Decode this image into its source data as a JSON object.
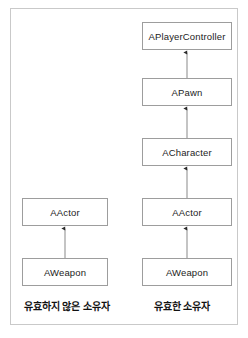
{
  "diagram": {
    "type": "class-inheritance-diagram",
    "frame": {
      "border_color": "#c9c9c9"
    },
    "box_style": {
      "border_color": "#9d9d9d",
      "fill": "#ffffff",
      "text_color": "#1c1c1c"
    },
    "arrow_style": {
      "line_color": "#9d9d9d",
      "head_color": "#2b2b2b",
      "direction": "points-up-to-parent"
    },
    "columns": [
      {
        "id": "invalid-owner",
        "caption": "유효하지 않은 소유자",
        "nodes": [
          {
            "id": "aactor-left",
            "label": "AActor"
          },
          {
            "id": "aweapon-left",
            "label": "AWeapon"
          }
        ],
        "edges": [
          {
            "from": "aweapon-left",
            "to": "aactor-left"
          }
        ]
      },
      {
        "id": "valid-owner",
        "caption": "유효한 소유자",
        "nodes": [
          {
            "id": "aplayercontroller",
            "label": "APlayerController"
          },
          {
            "id": "apawn",
            "label": "APawn"
          },
          {
            "id": "acharacter",
            "label": "ACharacter"
          },
          {
            "id": "aactor-right",
            "label": "AActor"
          },
          {
            "id": "aweapon-right",
            "label": "AWeapon"
          }
        ],
        "edges": [
          {
            "from": "apawn",
            "to": "aplayercontroller"
          },
          {
            "from": "acharacter",
            "to": "apawn"
          },
          {
            "from": "aactor-right",
            "to": "acharacter"
          },
          {
            "from": "aweapon-right",
            "to": "aactor-right"
          }
        ]
      }
    ]
  }
}
